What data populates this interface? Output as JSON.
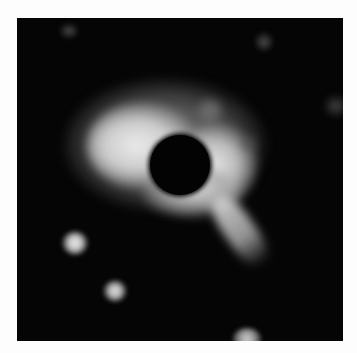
{
  "image": {
    "description": "Grayscale astronomical image with a dark occulting disk at center surrounded by a bright halo, a tail extending to the lower right, and several point sources",
    "colors": {
      "background": "#fdfdfd",
      "frame": "#050505",
      "halo": "#e0e0e0",
      "occulter": "#030303"
    },
    "features": [
      {
        "name": "central-occulter",
        "type": "dark disk"
      },
      {
        "name": "bright-halo",
        "type": "diffuse emission"
      },
      {
        "name": "tail",
        "type": "elongated emission toward lower right"
      },
      {
        "name": "point-source-1",
        "type": "star"
      },
      {
        "name": "point-source-2",
        "type": "star"
      },
      {
        "name": "point-source-3",
        "type": "star at bottom edge"
      }
    ]
  }
}
